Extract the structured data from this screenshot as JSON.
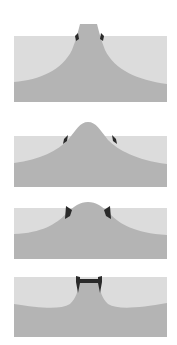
{
  "diagram": {
    "type": "cross-section-profiles",
    "panel_count": 4,
    "colors": {
      "background": "#ffffff",
      "upper_layer": "#dcdcdc",
      "lower_layer": "#b4b4b4",
      "marker": "#2a2a2a"
    },
    "panels": [
      {
        "id": 1,
        "profile": "mesa-with-flat-top-and-concave-flanks",
        "markers": "small dark nubs at surface contact on both sides"
      },
      {
        "id": 2,
        "profile": "rounded-gaussian-bump",
        "markers": "small dark wedges on both flanks at surface level"
      },
      {
        "id": 3,
        "profile": "rounded-bump-lower-peak",
        "markers": "larger dark wedges on both flanks at surface level"
      },
      {
        "id": 4,
        "profile": "narrow-mesa-with-dark-cap-bar",
        "markers": "dark H-shaped cap spanning top with side flanges"
      }
    ]
  }
}
